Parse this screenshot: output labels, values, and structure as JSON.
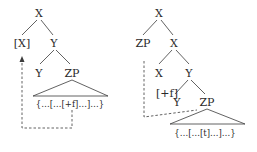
{
  "left_tree": {
    "root": "X",
    "left_child": "[X]",
    "right_child": "Y",
    "y_left": "Y",
    "y_right": "ZP",
    "zp_content": "{…[…[+f]…]…}"
  },
  "right_tree": {
    "root": "X",
    "spec": "ZP",
    "x_bar": "X",
    "x_head": "X",
    "y_node": "Y",
    "feature": "[+f]",
    "y_head": "Y",
    "zp": "ZP",
    "zp_content": "{…[…[t]…]…}"
  }
}
